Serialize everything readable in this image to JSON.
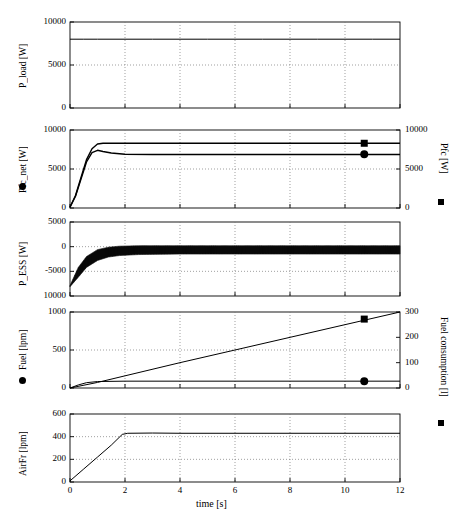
{
  "figure": {
    "subfigure_label": "(b)",
    "xlabel": "time [s]",
    "x_ticks": [
      0,
      2,
      4,
      6,
      8,
      10,
      12
    ],
    "x_tick_labels": [
      "0",
      "2",
      "4",
      "6",
      "8",
      "10",
      "12"
    ],
    "xlim": [
      0,
      12
    ]
  },
  "panels": [
    {
      "id": "p_load",
      "ylabel_left": "P_load [W]",
      "ylabel_right": "",
      "left_ticks": [
        0,
        5000,
        10000
      ],
      "left_tick_labels": [
        "0",
        "5000",
        "10000"
      ],
      "right_ticks": [],
      "right_tick_labels": [],
      "ylim_left": [
        0,
        10000
      ],
      "left_marker": "",
      "right_marker": ""
    },
    {
      "id": "pfc_net",
      "ylabel_left": "Pfc_net [W]",
      "ylabel_right": "Pfc [W]",
      "left_ticks": [
        0,
        5000,
        10000
      ],
      "left_tick_labels": [
        "0",
        "5000",
        "10000"
      ],
      "right_ticks": [
        0,
        5000,
        10000
      ],
      "right_tick_labels": [
        "0",
        "5000",
        "10000"
      ],
      "ylim_left": [
        0,
        10000
      ],
      "ylim_right": [
        0,
        10000
      ],
      "left_marker": "circle",
      "right_marker": "square"
    },
    {
      "id": "p_ess",
      "ylabel_left": "P_ESS [W]",
      "ylabel_right": "",
      "left_ticks": [
        -10000,
        -5000,
        0,
        5000
      ],
      "left_tick_labels": [
        "10000",
        "-5000",
        "0",
        "5000"
      ],
      "right_ticks": [],
      "right_tick_labels": [],
      "ylim_left": [
        -10000,
        5000
      ],
      "left_marker": "",
      "right_marker": ""
    },
    {
      "id": "fuel",
      "ylabel_left": "Fuel [lpm]",
      "ylabel_right": "Fuel consumption [l]",
      "left_ticks": [
        0,
        500,
        1000
      ],
      "left_tick_labels": [
        "0",
        "500",
        "1000"
      ],
      "right_ticks": [
        0,
        100,
        200,
        300
      ],
      "right_tick_labels": [
        "0",
        "100",
        "200",
        "300"
      ],
      "ylim_left": [
        0,
        1000
      ],
      "ylim_right": [
        0,
        300
      ],
      "left_marker": "circle",
      "right_marker": "square"
    },
    {
      "id": "airfr",
      "ylabel_left": "AirFr [lpm]",
      "ylabel_right": "",
      "left_ticks": [
        0,
        200,
        400,
        600
      ],
      "left_tick_labels": [
        "0",
        "200",
        "400",
        "600"
      ],
      "right_ticks": [],
      "right_tick_labels": [],
      "ylim_left": [
        0,
        600
      ],
      "left_marker": "",
      "right_marker": ""
    }
  ],
  "chart_data": {
    "type": "line",
    "title": "(b)",
    "xlabel": "time [s]",
    "x_unit": "s",
    "xlim": [
      0,
      12
    ],
    "x_ticks": [
      0,
      2,
      4,
      6,
      8,
      10,
      12
    ],
    "grid": true,
    "legend": "inline-axis-markers",
    "subplots": [
      {
        "name": "P_load",
        "ylabel": "P_load [W]",
        "ylim": [
          0,
          10000
        ],
        "yticks": [
          0,
          5000,
          10000
        ],
        "series": [
          {
            "name": "P_load",
            "style": "solid",
            "x": [
              0,
              0.5,
              1,
              2,
              3,
              4,
              5,
              6,
              7,
              8,
              9,
              10,
              11,
              12
            ],
            "values": [
              8000,
              8000,
              8000,
              8000,
              8000,
              8000,
              8000,
              8000,
              8000,
              8000,
              8000,
              8000,
              8000,
              8000
            ]
          }
        ]
      },
      {
        "name": "Pfc_net / Pfc",
        "ylabel_left": "Pfc_net [W]",
        "ylabel_right": "Pfc [W]",
        "ylim": [
          0,
          10000
        ],
        "yticks": [
          0,
          5000,
          10000
        ],
        "ylim_right": [
          0,
          10000
        ],
        "yticks_right": [
          0,
          5000,
          10000
        ],
        "series": [
          {
            "name": "Pfc",
            "marker": "square",
            "style": "solid",
            "x": [
              0,
              0.2,
              0.4,
              0.6,
              0.8,
              1.0,
              1.2,
              1.5,
              2.0,
              3.0,
              4.0,
              6.0,
              8.0,
              10.0,
              12.0
            ],
            "values": [
              120,
              1600,
              3900,
              6200,
              7600,
              8200,
              8300,
              8300,
              8300,
              8300,
              8300,
              8300,
              8300,
              8300,
              8300
            ],
            "marker_point": {
              "x": 10.7,
              "y": 8300
            }
          },
          {
            "name": "Pfc_net",
            "marker": "circle",
            "style": "solid",
            "x": [
              0,
              0.2,
              0.4,
              0.6,
              0.8,
              1.0,
              1.2,
              1.5,
              2.0,
              3.0,
              4.0,
              6.0,
              8.0,
              10.0,
              12.0
            ],
            "values": [
              100,
              1500,
              3700,
              5900,
              7100,
              7400,
              7250,
              7050,
              6900,
              6850,
              6850,
              6850,
              6850,
              6850,
              6850
            ],
            "marker_point": {
              "x": 10.7,
              "y": 6900
            }
          }
        ]
      },
      {
        "name": "P_ESS",
        "ylabel": "P_ESS [W]",
        "ylim": [
          -10000,
          5000
        ],
        "yticks": [
          -10000,
          -5000,
          0,
          5000
        ],
        "series": [
          {
            "name": "P_ESS (noisy band)",
            "style": "noisy-band",
            "x": [
              0,
              0.3,
              0.6,
              1.0,
              1.4,
              1.8,
              2.5,
              4.0,
              6.0,
              8.0,
              10.0,
              12.0
            ],
            "band_upper": [
              -7900,
              -4200,
              -2000,
              -600,
              -100,
              100,
              200,
              200,
              200,
              200,
              200,
              200
            ],
            "band_lower": [
              -8100,
              -6200,
              -4200,
              -2800,
              -2100,
              -1800,
              -1600,
              -1500,
              -1500,
              -1500,
              -1500,
              -1500
            ],
            "values": [
              -8000,
              -5200,
              -3100,
              -1700,
              -1100,
              -850,
              -700,
              -650,
              -650,
              -650,
              -650,
              -650
            ]
          }
        ]
      },
      {
        "name": "Fuel / Fuel consumption",
        "ylabel_left": "Fuel [lpm]",
        "ylabel_right": "Fuel consumption [l]",
        "ylim": [
          0,
          1000
        ],
        "yticks": [
          0,
          500,
          1000
        ],
        "ylim_right": [
          0,
          300
        ],
        "yticks_right": [
          0,
          100,
          200,
          300
        ],
        "series": [
          {
            "name": "Fuel consumption",
            "marker": "square",
            "style": "solid-ramp",
            "axis": "right",
            "x": [
              0,
              1,
              2,
              4,
              6,
              8,
              10,
              12
            ],
            "values": [
              0,
              22,
              48,
              100,
              150,
              200,
              250,
              300
            ],
            "marker_point": {
              "x": 10.7,
              "y": 272
            }
          },
          {
            "name": "Fuel",
            "marker": "circle",
            "style": "solid-flat",
            "axis": "left",
            "x": [
              0,
              0.3,
              0.6,
              1.0,
              2.0,
              4.0,
              6.0,
              8.0,
              10.0,
              12.0
            ],
            "values": [
              0,
              40,
              70,
              85,
              90,
              90,
              90,
              90,
              90,
              90
            ],
            "marker_point": {
              "x": 10.7,
              "y": 90
            }
          }
        ]
      },
      {
        "name": "AirFr",
        "ylabel": "AirFr [lpm]",
        "ylim": [
          0,
          600
        ],
        "yticks": [
          0,
          200,
          400,
          600
        ],
        "series": [
          {
            "name": "AirFr",
            "style": "solid",
            "x": [
              0,
              0.5,
              1.0,
              1.5,
              1.9,
              2.1,
              3.0,
              4.0,
              6.0,
              8.0,
              10.0,
              12.0
            ],
            "values": [
              10,
              115,
              220,
              325,
              420,
              430,
              432,
              430,
              430,
              430,
              430,
              430
            ]
          }
        ]
      }
    ]
  }
}
